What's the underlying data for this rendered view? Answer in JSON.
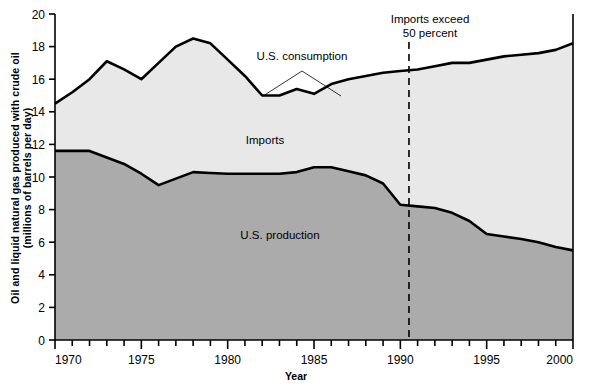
{
  "chart_data": {
    "type": "area",
    "title": "",
    "xlabel": "Year",
    "ylabel_line1": "Oil and liquid natural gas produced with crude oil",
    "ylabel_line2": "(millions of barrels per day)",
    "xlim": [
      1970,
      2000
    ],
    "ylim": [
      0,
      20
    ],
    "yticks": [
      0,
      2,
      4,
      6,
      8,
      10,
      12,
      14,
      16,
      18,
      20
    ],
    "xticks": [
      1970,
      1975,
      1980,
      1985,
      1990,
      1995,
      2000
    ],
    "xminor_step": 1,
    "grid": false,
    "legend_position": "inline-annotations",
    "stacked": true,
    "x": [
      1970,
      1971,
      1972,
      1973,
      1974,
      1975,
      1976,
      1977,
      1978,
      1979,
      1980,
      1981,
      1982,
      1983,
      1984,
      1985,
      1986,
      1987,
      1988,
      1989,
      1990,
      1991,
      1992,
      1993,
      1994,
      1995,
      1996,
      1997,
      1998,
      1999,
      2000
    ],
    "series": [
      {
        "name": "U.S. production",
        "fill_color": "#ababab",
        "values": [
          11.6,
          11.6,
          11.6,
          11.2,
          10.8,
          10.2,
          9.5,
          9.9,
          10.3,
          10.25,
          10.2,
          10.2,
          10.2,
          10.2,
          10.3,
          10.6,
          10.6,
          10.35,
          10.1,
          9.6,
          8.3,
          8.2,
          8.1,
          7.8,
          7.3,
          6.5,
          6.35,
          6.2,
          6.0,
          5.7,
          5.5
        ]
      },
      {
        "name": "U.S. consumption",
        "fill_color": "#e8e8e8",
        "values": [
          14.5,
          15.2,
          16.0,
          17.1,
          16.6,
          16.0,
          17.0,
          18.0,
          18.5,
          18.2,
          17.2,
          16.2,
          15.0,
          15.0,
          15.4,
          15.1,
          15.7,
          16.0,
          16.2,
          16.4,
          16.5,
          16.6,
          16.8,
          17.0,
          17.0,
          17.2,
          17.4,
          17.5,
          17.6,
          17.8,
          18.2
        ]
      }
    ],
    "annotations": [
      {
        "name": "consumption-label",
        "text": "U.S. consumption"
      },
      {
        "name": "imports-label",
        "text": "Imports"
      },
      {
        "name": "production-label",
        "text": "U.S. production"
      },
      {
        "name": "milestone-label",
        "line1": "Imports exceed",
        "line2": "50 percent",
        "x_value": 1990.5,
        "style": "dashed-vertical-line"
      }
    ]
  },
  "axis": {
    "y_tick_labels": [
      "0",
      "2",
      "4",
      "6",
      "8",
      "10",
      "12",
      "14",
      "16",
      "18",
      "20"
    ],
    "x_tick_labels": [
      "1970",
      "1975",
      "1980",
      "1985",
      "1990",
      "1995",
      "2000"
    ]
  },
  "labels": {
    "ylabel_line1": "Oil and liquid natural gas produced with crude oil",
    "ylabel_line2": "(millions of barrels per day)",
    "xlabel": "Year",
    "consumption": "U.S. consumption",
    "imports": "Imports",
    "production": "U.S. production",
    "milestone_line1": "Imports exceed",
    "milestone_line2": "50 percent"
  },
  "colors": {
    "imports_fill": "#e8e8e8",
    "production_fill": "#ababab",
    "line": "#000000",
    "background": "#ffffff"
  }
}
